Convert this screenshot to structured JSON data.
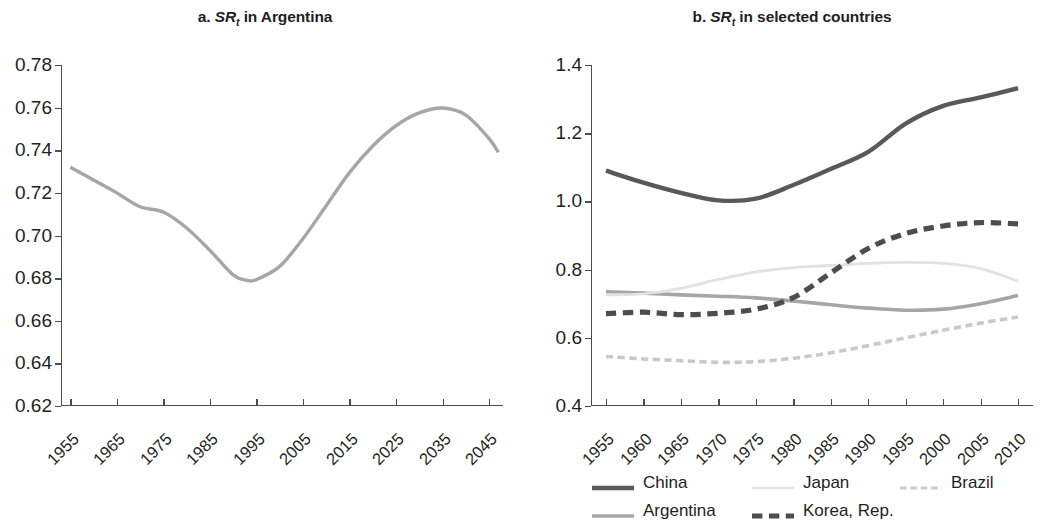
{
  "figure": {
    "panels": [
      {
        "id": "a",
        "title_prefix": "a.",
        "title_symbol": "SR",
        "title_subscript": "t",
        "title_suffix": "in Argentina"
      },
      {
        "id": "b",
        "title_prefix": "b.",
        "title_symbol": "SR",
        "title_subscript": "t",
        "title_suffix": "in selected countries"
      }
    ]
  },
  "legend": {
    "rows": [
      [
        {
          "label": "China",
          "color": "#595959",
          "style": "solid",
          "width": 4.4
        },
        {
          "label": "Japan",
          "color": "#e2e2e2",
          "style": "solid",
          "width": 2.6
        },
        {
          "label": "Brazil",
          "color": "#c9c9c9",
          "style": "dashed",
          "width": 3.2
        }
      ],
      [
        {
          "label": "Argentina",
          "color": "#a6a6a6",
          "style": "solid",
          "width": 3.6
        },
        {
          "label": "Korea, Rep.",
          "color": "#4d4d4d",
          "style": "dashed",
          "width": 5.2
        }
      ]
    ]
  },
  "chart_data": [
    {
      "type": "line",
      "panel": "a",
      "title": "a. SRt in Argentina",
      "xlabel": "",
      "ylabel": "",
      "xlim": [
        1953,
        2048
      ],
      "ylim": [
        0.62,
        0.78
      ],
      "grid": false,
      "legend_position": "none",
      "yticks": [
        "0.78",
        "0.76",
        "0.74",
        "0.72",
        "0.70",
        "0.68",
        "0.66",
        "0.64",
        "0.62"
      ],
      "ytick_values": [
        0.78,
        0.76,
        0.74,
        0.72,
        0.7,
        0.68,
        0.66,
        0.64,
        0.62
      ],
      "xticks": [
        "1955",
        "1965",
        "1975",
        "1985",
        "1995",
        "2005",
        "2015",
        "2025",
        "2035",
        "2045"
      ],
      "xtick_values": [
        1955,
        1965,
        1975,
        1985,
        1995,
        2005,
        2015,
        2025,
        2035,
        2045
      ],
      "series": [
        {
          "name": "Argentina",
          "color": "#a6a6a6",
          "style": "solid",
          "width": 3.4,
          "x": [
            1955,
            1960,
            1965,
            1970,
            1975,
            1980,
            1985,
            1990,
            1993,
            1995,
            2000,
            2005,
            2010,
            2015,
            2020,
            2025,
            2030,
            2035,
            2040,
            2045,
            2047
          ],
          "values": [
            0.732,
            0.726,
            0.72,
            0.7135,
            0.711,
            0.7035,
            0.693,
            0.6815,
            0.679,
            0.6793,
            0.6855,
            0.6985,
            0.714,
            0.7295,
            0.742,
            0.7515,
            0.7575,
            0.7598,
            0.7565,
            0.7455,
            0.739
          ]
        }
      ]
    },
    {
      "type": "line",
      "panel": "b",
      "title": "b. SRt in selected countries",
      "xlabel": "",
      "ylabel": "",
      "xlim": [
        1953,
        2012
      ],
      "ylim": [
        0.4,
        1.4
      ],
      "grid": false,
      "legend_position": "bottom",
      "yticks": [
        "1.4",
        "1.2",
        "1.0",
        "0.8",
        "0.6",
        "0.4"
      ],
      "ytick_values": [
        1.4,
        1.2,
        1.0,
        0.8,
        0.6,
        0.4
      ],
      "xticks": [
        "1955",
        "1960",
        "1965",
        "1970",
        "1975",
        "1980",
        "1985",
        "1990",
        "1995",
        "2000",
        "2005",
        "2010"
      ],
      "xtick_values": [
        1955,
        1960,
        1965,
        1970,
        1975,
        1980,
        1985,
        1990,
        1995,
        2000,
        2005,
        2010
      ],
      "x": [
        1955,
        1960,
        1965,
        1970,
        1975,
        1980,
        1985,
        1990,
        1995,
        2000,
        2005,
        2010
      ],
      "series": [
        {
          "name": "China",
          "color": "#595959",
          "style": "solid",
          "width": 4.4,
          "values": [
            1.09,
            1.055,
            1.025,
            1.003,
            1.008,
            1.048,
            1.095,
            1.145,
            1.228,
            1.28,
            1.305,
            1.332
          ]
        },
        {
          "name": "Argentina",
          "color": "#a6a6a6",
          "style": "solid",
          "width": 3.6,
          "values": [
            0.735,
            0.731,
            0.726,
            0.722,
            0.717,
            0.708,
            0.697,
            0.687,
            0.681,
            0.684,
            0.7,
            0.724
          ]
        },
        {
          "name": "Japan",
          "color": "#e2e2e2",
          "style": "solid",
          "width": 2.8,
          "values": [
            0.726,
            0.729,
            0.745,
            0.771,
            0.793,
            0.806,
            0.812,
            0.818,
            0.821,
            0.818,
            0.803,
            0.766
          ]
        },
        {
          "name": "Korea, Rep.",
          "color": "#4d4d4d",
          "style": "dashed",
          "width": 5.2,
          "values": [
            0.671,
            0.675,
            0.668,
            0.672,
            0.684,
            0.718,
            0.79,
            0.862,
            0.906,
            0.928,
            0.938,
            0.934
          ]
        },
        {
          "name": "Brazil",
          "color": "#c9c9c9",
          "style": "dashed",
          "width": 3.6,
          "values": [
            0.545,
            0.538,
            0.533,
            0.528,
            0.53,
            0.54,
            0.556,
            0.577,
            0.6,
            0.622,
            0.643,
            0.661
          ]
        }
      ]
    }
  ]
}
